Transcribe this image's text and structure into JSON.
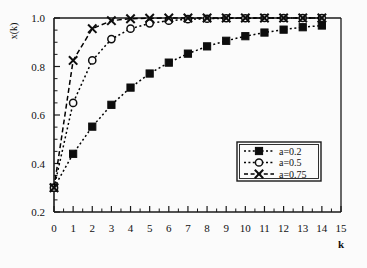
{
  "chart_data": {
    "type": "line",
    "title": "",
    "xlabel": "k",
    "ylabel": "x(k)",
    "xlim": [
      0,
      15
    ],
    "ylim": [
      0.2,
      1.0
    ],
    "xticks": [
      0,
      1,
      2,
      3,
      4,
      5,
      6,
      7,
      8,
      9,
      10,
      11,
      12,
      13,
      14,
      15
    ],
    "xtick_labels": [
      "0",
      "1",
      "2",
      "3",
      "4",
      "5",
      "6",
      "7",
      "8",
      "9",
      "10",
      "11",
      "12",
      "13",
      "14",
      "15"
    ],
    "yticks": [
      0.2,
      0.4,
      0.6,
      0.8,
      1.0
    ],
    "ytick_labels": [
      "0.2",
      "0.4",
      "0.6",
      "0.8",
      "1.0"
    ],
    "minor_x_step": 0.5,
    "minor_y_step": 0.05,
    "grid": false,
    "legend_position": "center-right",
    "initial_value": 0.3,
    "model": "x(k) = 1 - (1 - 0.3) * (1 - a)^k",
    "x": [
      0,
      1,
      2,
      3,
      4,
      5,
      6,
      7,
      8,
      9,
      10,
      11,
      12,
      13,
      14
    ],
    "series": [
      {
        "name": "a=0.2",
        "a": 0.2,
        "marker": "filled-square",
        "linestyle": "dotted",
        "color": "#000000",
        "values": [
          0.3,
          0.44,
          0.552,
          0.642,
          0.713,
          0.771,
          0.816,
          0.853,
          0.883,
          0.906,
          0.925,
          0.94,
          0.952,
          0.962,
          0.969
        ]
      },
      {
        "name": "a=0.5",
        "a": 0.5,
        "marker": "open-circle",
        "linestyle": "dotted",
        "color": "#000000",
        "values": [
          0.3,
          0.65,
          0.825,
          0.913,
          0.956,
          0.978,
          0.989,
          0.995,
          0.997,
          0.999,
          0.999,
          1.0,
          1.0,
          1.0,
          1.0
        ]
      },
      {
        "name": "a=0.75",
        "a": 0.75,
        "marker": "cross-x",
        "linestyle": "dashed",
        "color": "#000000",
        "values": [
          0.3,
          0.825,
          0.956,
          0.989,
          0.997,
          0.999,
          1.0,
          1.0,
          1.0,
          1.0,
          1.0,
          1.0,
          1.0,
          1.0,
          1.0
        ]
      }
    ]
  },
  "legend": {
    "entries": [
      {
        "label": "a=0.2"
      },
      {
        "label": "a=0.5"
      },
      {
        "label": "a=0.75"
      }
    ]
  },
  "axis": {
    "y_title": "x(k)",
    "x_title": "k"
  }
}
